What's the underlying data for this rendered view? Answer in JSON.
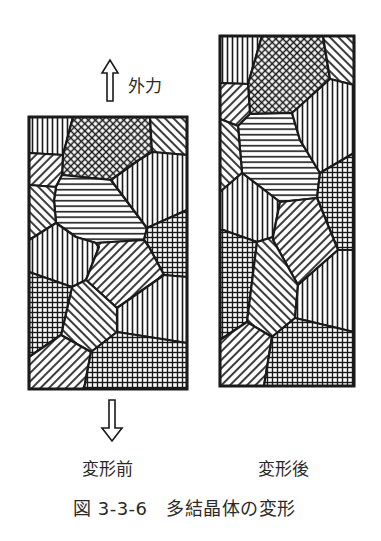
{
  "figure": {
    "caption": "図 3-3-6　多結晶体の変形",
    "force_label": "外力",
    "panels": [
      {
        "id": "before",
        "label": "変形前",
        "frame": [
          29,
          117,
          187,
          389
        ],
        "grains": [
          {
            "pattern": "vert",
            "points": "29,117 73,117 63,155 29,153"
          },
          {
            "pattern": "cross",
            "points": "73,117 150,117 152,152 139,160 111,180 62,175 63,155"
          },
          {
            "pattern": "diagB",
            "points": "150,117 187,117 187,155 152,152"
          },
          {
            "pattern": "diagF",
            "points": "29,153 63,155 62,175 56,187 29,185"
          },
          {
            "pattern": "horiz",
            "points": "56,187 62,175 111,180 147,228 144,240 96,243 76,237 56,223 54,200"
          },
          {
            "pattern": "vert",
            "points": "111,180 139,160 152,152 187,155 187,210 147,228"
          },
          {
            "pattern": "grid",
            "points": "147,228 187,210 187,277 164,275 149,247 144,240"
          },
          {
            "pattern": "diagB",
            "points": "29,185 56,187 54,200 56,223 34,237 29,240"
          },
          {
            "pattern": "vert",
            "points": "29,240 34,237 56,223 76,237 96,243 99,247 86,280 72,287 29,272"
          },
          {
            "pattern": "diagF",
            "points": "99,247 96,243 144,240 149,247 164,275 117,308 86,280"
          },
          {
            "pattern": "vert",
            "points": "164,275 187,277 187,343 117,332 117,308"
          },
          {
            "pattern": "diagB",
            "points": "72,287 86,280 117,308 117,332 91,352 61,335"
          },
          {
            "pattern": "grid",
            "points": "29,272 72,287 61,335 29,357"
          },
          {
            "pattern": "diagF",
            "points": "29,357 61,335 91,352 84,389 29,389"
          },
          {
            "pattern": "grid",
            "points": "91,352 117,332 187,343 187,389 84,389"
          }
        ]
      },
      {
        "id": "after",
        "label": "変形後",
        "frame": [
          220,
          36,
          354,
          386
        ],
        "grains": [
          {
            "pattern": "vert",
            "points": "220,36 262,36 248,84 220,83"
          },
          {
            "pattern": "cross",
            "points": "262,36 323,36 330,79 300,106 292,113 250,114 248,84"
          },
          {
            "pattern": "diagB",
            "points": "323,36 354,36 354,85 330,79"
          },
          {
            "pattern": "diagF",
            "points": "220,83 248,84 250,114 238,126 220,119"
          },
          {
            "pattern": "horiz",
            "points": "238,126 250,114 292,113 300,140 320,173 317,198 280,202 242,173"
          },
          {
            "pattern": "vert",
            "points": "292,113 300,106 330,79 354,85 354,153 320,173 300,140"
          },
          {
            "pattern": "diagB",
            "points": "220,119 238,126 242,173 220,192"
          },
          {
            "pattern": "grid",
            "points": "320,173 354,153 354,250 338,250 317,198"
          },
          {
            "pattern": "vert",
            "points": "220,192 242,173 280,202 273,237 257,242 223,230 220,230"
          },
          {
            "pattern": "diagF",
            "points": "280,202 317,198 338,250 298,285 273,240 273,237"
          },
          {
            "pattern": "grid",
            "points": "220,230 223,230 257,242 247,322 220,340"
          },
          {
            "pattern": "diagB",
            "points": "257,242 273,237 273,240 298,285 295,318 272,337 247,322"
          },
          {
            "pattern": "vert",
            "points": "298,285 338,250 354,250 354,332 295,318"
          },
          {
            "pattern": "diagF",
            "points": "220,340 247,322 272,337 264,386 220,386"
          },
          {
            "pattern": "grid",
            "points": "272,337 295,318 354,332 354,386 264,386"
          }
        ]
      }
    ],
    "arrows": [
      {
        "direction": "up",
        "points": "107,101 113,101 113,73 118,73 110,60 102,73 107,73"
      },
      {
        "direction": "down",
        "points": "109,400 115,400 115,428 122,428 112,441 102,428 109,428"
      }
    ],
    "colors": {
      "ink": "#1a1a1a",
      "paper": "#ffffff",
      "text": "#2a2a2a"
    }
  }
}
